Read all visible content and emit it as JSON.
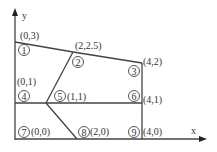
{
  "axes": {
    "x_label": "x",
    "y_label": "y"
  },
  "nodes": [
    {
      "id": "1",
      "coord": "(0,3)"
    },
    {
      "id": "2",
      "coord": "(2,2.5)"
    },
    {
      "id": "3",
      "coord": "(4,2)"
    },
    {
      "id": "4",
      "coord": "(0,1)"
    },
    {
      "id": "5",
      "coord": "(1,1)"
    },
    {
      "id": "6",
      "coord": "(4,1)"
    },
    {
      "id": "7",
      "coord": "(0,0)"
    },
    {
      "id": "8",
      "coord": "(2,0)"
    },
    {
      "id": "9",
      "coord": "(4,0)"
    }
  ]
}
